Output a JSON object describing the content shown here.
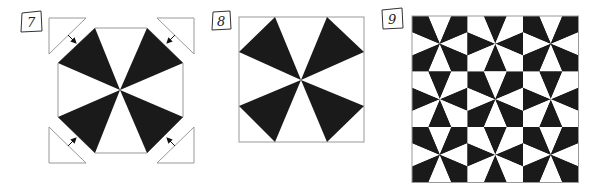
{
  "figure": {
    "panels": [
      {
        "id": "panel-7",
        "label": "7",
        "description": "Octagon pinwheel with four corner triangles and arrows pointing inward"
      },
      {
        "id": "panel-8",
        "label": "8",
        "description": "Assembled square block with four black kite-shaped wedges"
      },
      {
        "id": "panel-9",
        "label": "9",
        "description": "3x3 grid of blocks with alternating black/white wedge colorings"
      }
    ]
  },
  "colors": {
    "fill": "#1a1a1a",
    "outline": "#999999",
    "background": "#ffffff"
  }
}
